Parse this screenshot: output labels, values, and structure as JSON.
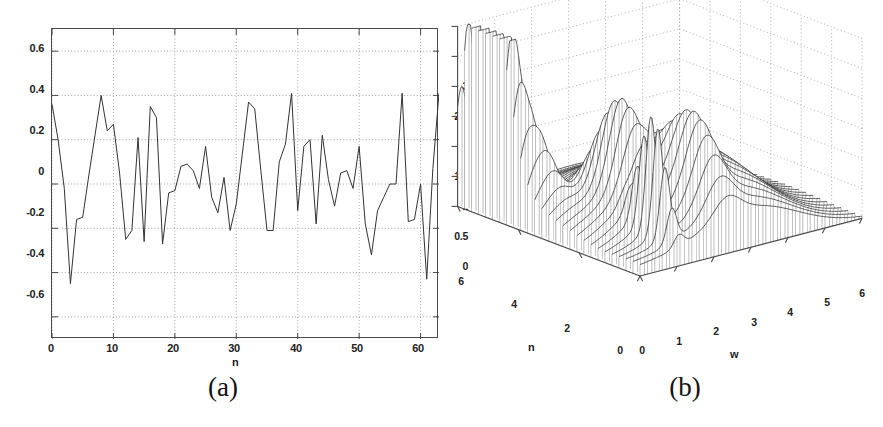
{
  "figure": {
    "background": "#ffffff",
    "line_color": "#333333",
    "axis_color": "#4a4a4a",
    "grid_color": "#8a8a8a"
  },
  "panel_a": {
    "caption": "(a)",
    "xlabel": "n",
    "ylabel": "",
    "xticks": [
      "0",
      "10",
      "20",
      "30",
      "40",
      "50",
      "60"
    ],
    "yticks": [
      "0.6",
      "0.4",
      "0.2",
      "0",
      "-0.2",
      "-0.4",
      "-0.6"
    ],
    "xlim": [
      0,
      63
    ],
    "ylim": [
      -0.7,
      0.7
    ],
    "grid": true
  },
  "panel_b": {
    "caption": "(b)",
    "xlabel": "w",
    "ylabel": "n",
    "zlabel": "",
    "wticks": [
      "0",
      "1",
      "2",
      "3",
      "4",
      "5",
      "6"
    ],
    "nticks": [
      "0",
      "2",
      "4",
      "6"
    ],
    "zticks": [
      "0",
      "0.5",
      "1",
      "1.5",
      "2",
      "2.5",
      "3"
    ],
    "wlim": [
      0,
      6
    ],
    "nlim": [
      0,
      6
    ],
    "zlim": [
      0,
      3
    ],
    "grid": true
  },
  "chart_data": [
    {
      "type": "line",
      "panel": "(a)",
      "title": "",
      "xlabel": "n",
      "ylabel": "",
      "xlim": [
        0,
        63
      ],
      "ylim": [
        -0.7,
        0.7
      ],
      "xticks": [
        0,
        10,
        20,
        30,
        40,
        50,
        60
      ],
      "yticks": [
        -0.6,
        -0.4,
        -0.2,
        0,
        0.2,
        0.4,
        0.6
      ],
      "grid": true,
      "legend": null,
      "x": [
        0,
        1,
        2,
        3,
        4,
        5,
        6,
        7,
        8,
        9,
        10,
        11,
        12,
        13,
        14,
        15,
        16,
        17,
        18,
        19,
        20,
        21,
        22,
        23,
        24,
        25,
        26,
        27,
        28,
        29,
        30,
        31,
        32,
        33,
        34,
        35,
        36,
        37,
        38,
        39,
        40,
        41,
        42,
        43,
        44,
        45,
        46,
        47,
        48,
        49,
        50,
        51,
        52,
        53,
        54,
        55,
        56,
        57,
        58,
        59,
        60,
        61,
        62,
        63
      ],
      "values": [
        0.36,
        0.2,
        -0.02,
        -0.45,
        -0.16,
        -0.15,
        0.04,
        0.22,
        0.4,
        0.24,
        0.27,
        0.05,
        -0.25,
        -0.21,
        0.21,
        -0.26,
        0.35,
        0.3,
        -0.27,
        -0.04,
        -0.03,
        0.08,
        0.09,
        0.06,
        -0.02,
        0.17,
        -0.06,
        -0.13,
        0.03,
        -0.21,
        -0.09,
        0.14,
        0.37,
        0.34,
        0.06,
        -0.21,
        -0.21,
        0.1,
        0.18,
        0.41,
        -0.12,
        0.17,
        0.2,
        -0.18,
        0.22,
        0.02,
        -0.1,
        0.05,
        0.06,
        -0.02,
        0.17,
        -0.18,
        -0.32,
        -0.12,
        -0.06,
        0.0,
        0.0,
        0.41,
        -0.17,
        -0.16,
        0.0,
        -0.43,
        0.07,
        0.41
      ]
    },
    {
      "type": "surface",
      "panel": "(b)",
      "title": "",
      "xlabel": "w",
      "ylabel": "n",
      "zlabel": "",
      "xlim": [
        0,
        6
      ],
      "ylim": [
        0,
        6
      ],
      "zlim": [
        0,
        3
      ],
      "xticks": [
        0,
        1,
        2,
        3,
        4,
        5,
        6
      ],
      "yticks": [
        0,
        2,
        4,
        6
      ],
      "zticks": [
        0,
        0.5,
        1,
        1.5,
        2,
        2.5,
        3
      ],
      "grid": true,
      "description": "Mesh waterfall surface: sharp peak near w=0 reaching ~3.0 at large n, secondary ridge peak ~1.3 near mid-range, tall narrow spike ~1.9 near w=1, broad decaying ridges toward w=6",
      "peaks": [
        {
          "w": 0.15,
          "n": 5.4,
          "z": 3.0
        },
        {
          "w": 0.15,
          "n": 4.6,
          "z": 2.1
        },
        {
          "w": 0.55,
          "n": 4.2,
          "z": 0.95
        },
        {
          "w": 1.6,
          "n": 2.6,
          "z": 1.3
        },
        {
          "w": 1.05,
          "n": 0.9,
          "z": 1.9
        },
        {
          "w": 2.4,
          "n": 1.1,
          "z": 1.05
        }
      ]
    }
  ]
}
